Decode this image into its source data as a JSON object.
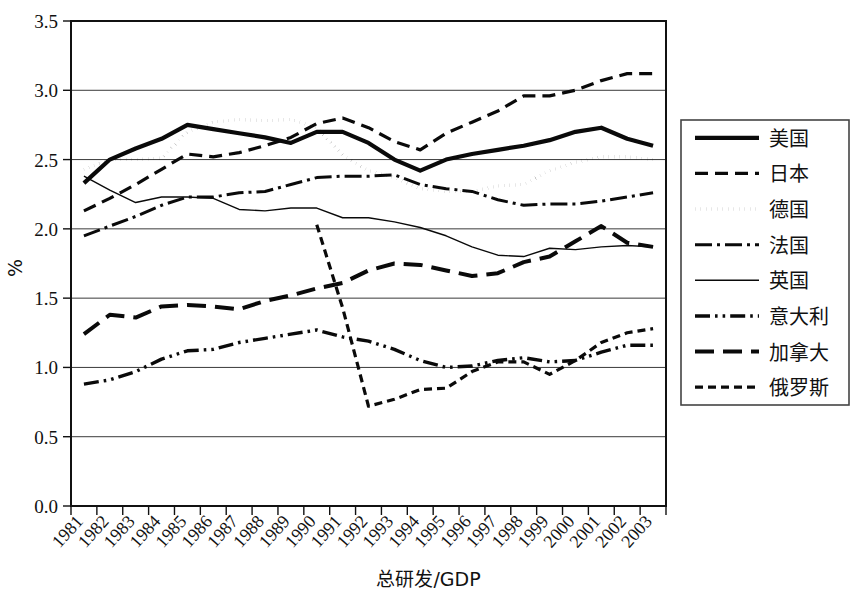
{
  "chart_data": {
    "type": "line",
    "title": "",
    "xlabel": "总研发/GDP",
    "ylabel": "%",
    "ylim": [
      0.0,
      3.5
    ],
    "ytick_labels": [
      "0.0",
      "0.5",
      "1.0",
      "1.5",
      "2.0",
      "2.5",
      "3.0",
      "3.5"
    ],
    "ytick_values": [
      0.0,
      0.5,
      1.0,
      1.5,
      2.0,
      2.5,
      3.0,
      3.5
    ],
    "grid": true,
    "legend_position": "right",
    "categories": [
      "1981",
      "1982",
      "1983",
      "1984",
      "1985",
      "1986",
      "1987",
      "1988",
      "1989",
      "1990",
      "1991",
      "1992",
      "1993",
      "1994",
      "1995",
      "1996",
      "1997",
      "1998",
      "1999",
      "2000",
      "2001",
      "2002",
      "2003"
    ],
    "series": [
      {
        "name": "美国",
        "style": "solid-thick",
        "values": [
          2.33,
          2.5,
          2.58,
          2.65,
          2.75,
          2.72,
          2.69,
          2.66,
          2.62,
          2.7,
          2.7,
          2.62,
          2.5,
          2.42,
          2.5,
          2.54,
          2.57,
          2.6,
          2.64,
          2.7,
          2.73,
          2.65,
          2.6
        ]
      },
      {
        "name": "日本",
        "style": "dashed",
        "values": [
          2.13,
          2.22,
          2.32,
          2.43,
          2.54,
          2.52,
          2.55,
          2.6,
          2.66,
          2.76,
          2.8,
          2.73,
          2.63,
          2.57,
          2.69,
          2.77,
          2.85,
          2.96,
          2.96,
          3.0,
          3.07,
          3.12,
          3.12
        ]
      },
      {
        "name": "德国",
        "style": "dotted",
        "values": [
          2.43,
          2.5,
          2.5,
          2.51,
          2.7,
          2.77,
          2.79,
          2.78,
          2.79,
          2.73,
          2.53,
          2.42,
          2.37,
          2.29,
          2.27,
          2.27,
          2.31,
          2.32,
          2.42,
          2.48,
          2.52,
          2.52,
          2.5
        ]
      },
      {
        "name": "法国",
        "style": "dashdot",
        "values": [
          1.95,
          2.02,
          2.09,
          2.17,
          2.23,
          2.23,
          2.26,
          2.27,
          2.32,
          2.37,
          2.38,
          2.38,
          2.39,
          2.32,
          2.29,
          2.27,
          2.21,
          2.17,
          2.18,
          2.18,
          2.2,
          2.23,
          2.26
        ]
      },
      {
        "name": "英国",
        "style": "solid-thin",
        "values": [
          2.38,
          2.28,
          2.19,
          2.23,
          2.23,
          2.22,
          2.14,
          2.13,
          2.15,
          2.15,
          2.08,
          2.08,
          2.05,
          2.01,
          1.95,
          1.87,
          1.81,
          1.8,
          1.86,
          1.85,
          1.87,
          1.88,
          1.87
        ]
      },
      {
        "name": "意大利",
        "style": "dashdotdot",
        "values": [
          0.88,
          0.91,
          0.97,
          1.06,
          1.12,
          1.13,
          1.18,
          1.21,
          1.24,
          1.27,
          1.22,
          1.19,
          1.13,
          1.05,
          1.0,
          1.01,
          1.05,
          1.07,
          1.04,
          1.05,
          1.11,
          1.16,
          1.16
        ]
      },
      {
        "name": "加拿大",
        "style": "dashed-long",
        "values": [
          1.24,
          1.38,
          1.36,
          1.44,
          1.45,
          1.44,
          1.42,
          1.48,
          1.52,
          1.57,
          1.61,
          1.7,
          1.75,
          1.74,
          1.7,
          1.66,
          1.68,
          1.76,
          1.8,
          1.91,
          2.02,
          1.9,
          1.87
        ]
      },
      {
        "name": "俄罗斯",
        "style": "dashed-short",
        "values": [
          null,
          null,
          null,
          null,
          null,
          null,
          null,
          null,
          null,
          2.03,
          1.43,
          0.72,
          0.77,
          0.84,
          0.85,
          0.97,
          1.04,
          1.04,
          0.95,
          1.05,
          1.18,
          1.25,
          1.28
        ]
      }
    ]
  },
  "legend": {
    "items": [
      {
        "label": "美国",
        "style": "solid-thick"
      },
      {
        "label": "日本",
        "style": "dashed"
      },
      {
        "label": "德国",
        "style": "dotted"
      },
      {
        "label": "法国",
        "style": "dashdot"
      },
      {
        "label": "英国",
        "style": "solid-thin"
      },
      {
        "label": "意大利",
        "style": "dashdotdot"
      },
      {
        "label": "加拿大",
        "style": "dashed-long"
      },
      {
        "label": "俄罗斯",
        "style": "dashed-short"
      }
    ]
  },
  "colors": {
    "ink": "#0a0a0a",
    "grid": "#3a3a3a",
    "background": "#ffffff"
  }
}
